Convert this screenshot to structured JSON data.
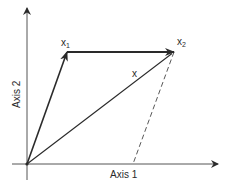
{
  "diagram": {
    "axes": {
      "horizontal_label": "Axis 1",
      "vertical_label": "Axis 2"
    },
    "vectors": [
      {
        "name": "x1",
        "label": "x",
        "subscript": "1",
        "from": [
          27,
          164
        ],
        "to": [
          67,
          52
        ]
      },
      {
        "name": "x2",
        "label": "x",
        "subscript": "2",
        "from": [
          67,
          52
        ],
        "to": [
          174,
          52
        ]
      },
      {
        "name": "x",
        "label": "x",
        "subscript": "",
        "from": [
          27,
          164
        ],
        "to": [
          174,
          52
        ]
      }
    ],
    "projection": {
      "style": "dashed",
      "from": [
        174,
        52
      ],
      "to": [
        133,
        164
      ]
    },
    "colors": {
      "ink": "#2a2a2a",
      "background": "#ffffff"
    }
  }
}
